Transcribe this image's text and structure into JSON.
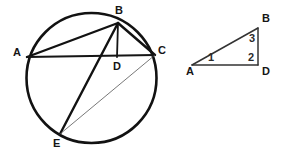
{
  "figure": {
    "background_color": "#ffffff",
    "ink_color": "#121212",
    "thin_line_color": "#555555",
    "triangle_line_color": "#333333"
  },
  "circle_diagram": {
    "name": "circle-with-inscribed-chords",
    "circle": {
      "cx": 91.5,
      "cy": 78,
      "r": 65
    },
    "points": [
      {
        "id": "A",
        "label": "A",
        "x": 27,
        "y": 57,
        "label_x": 13,
        "label_y": 56
      },
      {
        "id": "B",
        "label": "B",
        "x": 118,
        "y": 23,
        "label_x": 115,
        "label_y": 14
      },
      {
        "id": "C",
        "label": "C",
        "x": 155,
        "y": 55,
        "label_x": 158,
        "label_y": 54
      },
      {
        "id": "D",
        "label": "D",
        "x": 117,
        "y": 57,
        "label_x": 113,
        "label_y": 70
      },
      {
        "id": "E",
        "label": "E",
        "x": 60,
        "y": 134,
        "label_x": 53,
        "label_y": 147
      }
    ],
    "segments": [
      {
        "id": "AB",
        "from": "A",
        "to": "B",
        "weight": "thick"
      },
      {
        "id": "AC",
        "from": "A",
        "to": "C",
        "weight": "medium"
      },
      {
        "id": "BC",
        "from": "B",
        "to": "C",
        "weight": "thick"
      },
      {
        "id": "BD",
        "from": "B",
        "to": "D",
        "weight": "medium"
      },
      {
        "id": "BE",
        "from": "B",
        "to": "E",
        "weight": "thick"
      },
      {
        "id": "CE",
        "from": "C",
        "to": "E",
        "weight": "thin"
      }
    ]
  },
  "triangle_diagram": {
    "name": "right-triangle-abd",
    "points": [
      {
        "id": "A",
        "label": "A",
        "x": 192,
        "y": 65,
        "label_x": 186,
        "label_y": 75
      },
      {
        "id": "B",
        "label": "B",
        "x": 258,
        "y": 28,
        "label_x": 262,
        "label_y": 22
      },
      {
        "id": "D",
        "label": "D",
        "x": 258,
        "y": 65,
        "label_x": 262,
        "label_y": 75
      }
    ],
    "segments": [
      {
        "id": "AB",
        "from": "A",
        "to": "B"
      },
      {
        "id": "BD",
        "from": "B",
        "to": "D"
      },
      {
        "id": "AD",
        "from": "A",
        "to": "D"
      }
    ],
    "angle_labels": [
      {
        "id": "angle-1",
        "text": "1",
        "x": 208,
        "y": 61,
        "at_vertex": "A"
      },
      {
        "id": "angle-2",
        "text": "2",
        "x": 248,
        "y": 61,
        "at_vertex": "D"
      },
      {
        "id": "angle-3",
        "text": "3",
        "x": 249,
        "y": 42,
        "at_vertex": "B"
      }
    ]
  }
}
